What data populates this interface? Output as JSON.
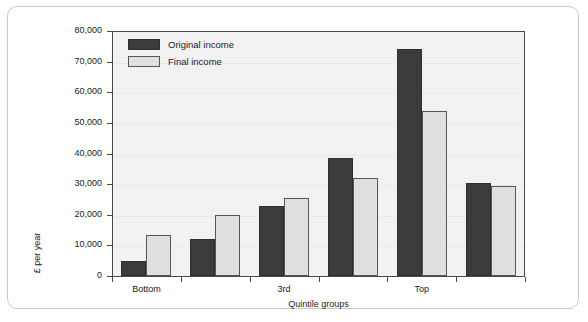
{
  "chart_data": {
    "type": "bar",
    "title": "",
    "xlabel": "Quintile groups",
    "ylabel": "£ per year",
    "ylim": [
      0,
      80000
    ],
    "yticks": [
      "0",
      "10,000",
      "20,000",
      "30,000",
      "40,000",
      "50,000",
      "60,000",
      "70,000",
      "80,000"
    ],
    "ytick_values": [
      0,
      10000,
      20000,
      30000,
      40000,
      50000,
      60000,
      70000,
      80000
    ],
    "grid": true,
    "legend_position": "top-left",
    "categories": [
      "Bottom",
      "2nd",
      "3rd",
      "4th",
      "Top",
      "All households"
    ],
    "visible_tick_labels": [
      "Bottom",
      "3rd",
      "Top"
    ],
    "series": [
      {
        "name": "Original income",
        "color": "#3b3b3b",
        "values": [
          5000,
          12000,
          23000,
          38500,
          74000,
          30500
        ]
      },
      {
        "name": "Final income",
        "color": "#e3e3e3",
        "values": [
          13500,
          20000,
          25500,
          32000,
          54000,
          29500
        ]
      }
    ]
  },
  "legend": {
    "items": [
      {
        "label": "Original income",
        "swatch": "original"
      },
      {
        "label": "Final income",
        "swatch": "final"
      }
    ]
  }
}
